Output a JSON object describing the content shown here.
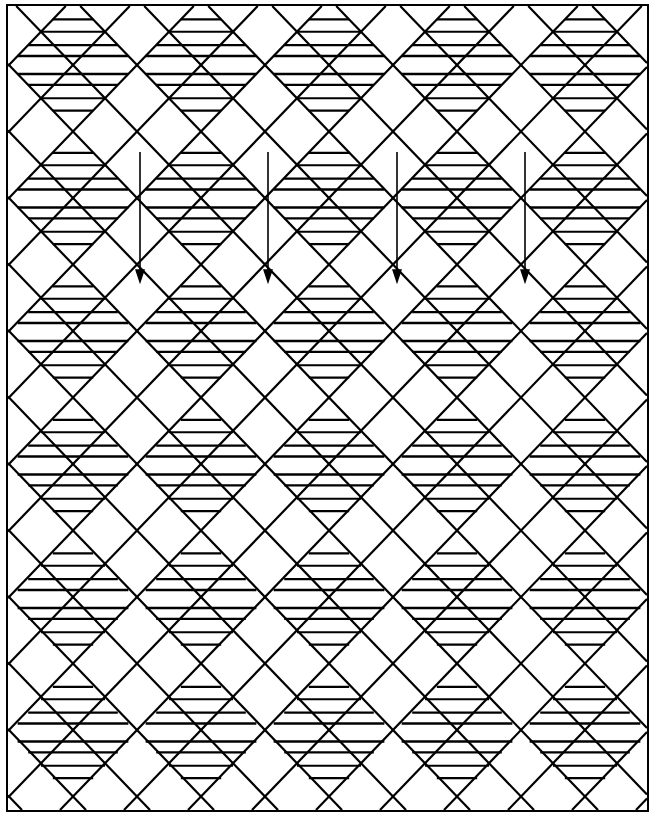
{
  "figure": {
    "type": "lattice-diamond-diagram",
    "columns": 5,
    "edge_marker": "6",
    "arrow_count": 4,
    "edge_markers_left": [
      "6",
      "6",
      "6",
      "6",
      "6",
      "6"
    ],
    "edge_markers_right": [
      "6",
      "6",
      "6",
      "6",
      "6",
      "6"
    ],
    "edge_markers_top": [
      "6",
      "6",
      "6",
      "6"
    ]
  },
  "columns": [
    {
      "index": 0,
      "diamonds": [
        {
          "name": "6y",
          "top": [
            "3",
            "2",
            "16",
            "23"
          ],
          "bottom": [
            "13",
            "4",
            "20",
            "19"
          ]
        },
        {
          "name": "6z",
          "top": [
            "2",
            "16",
            "19",
            "4"
          ],
          "bottom": [
            "13",
            "8",
            "22",
            "16"
          ]
        },
        {
          "name": "6aa",
          "top": [
            "8",
            "2",
            "5",
            "1"
          ],
          "bottom": [
            "8",
            "13",
            "4",
            "6"
          ]
        },
        {
          "name": "6bb",
          "top": [
            "2",
            "23",
            "16",
            "15"
          ],
          "bottom": [
            "19",
            "1",
            "20",
            "4"
          ]
        },
        {
          "name": "6cc",
          "top": [
            "3",
            "4",
            "22",
            "1"
          ],
          "bottom": [
            "8",
            "2",
            "20",
            ""
          ]
        },
        {
          "name": "6dd",
          "top": [
            "7",
            "1",
            "20",
            "24"
          ],
          "bottom": [
            "7",
            "2",
            "1",
            "3"
          ]
        }
      ]
    },
    {
      "index": 1,
      "diamonds": [
        {
          "name": "6s",
          "top": [
            "24",
            "13",
            "1",
            "15"
          ],
          "bottom": [
            "3",
            "11",
            "23",
            "16"
          ]
        },
        {
          "name": "6t",
          "top": [
            "23",
            "17",
            "13",
            "20"
          ],
          "bottom": [
            "3",
            "21",
            "8",
            "15"
          ]
        },
        {
          "name": "6u",
          "top": [
            "4",
            "4",
            "13",
            "23"
          ],
          "bottom": [
            "17",
            "2",
            "15",
            "23"
          ]
        },
        {
          "name": "6v",
          "top": [
            "23",
            "2",
            "13",
            "20"
          ],
          "bottom": [
            "4",
            "17",
            "23",
            "4"
          ]
        },
        {
          "name": "6w",
          "top": [
            "4",
            "20",
            "17",
            "13"
          ],
          "bottom": [
            "2",
            "16",
            "20",
            "8"
          ]
        },
        {
          "name": "6x",
          "top": [
            "3",
            "16",
            "23",
            "4"
          ],
          "bottom": [
            "15",
            "17",
            "13",
            "9"
          ]
        }
      ]
    },
    {
      "index": 2,
      "diamonds": [
        {
          "name": "6m",
          "top": [
            "4",
            "16",
            "2",
            "18"
          ],
          "bottom": [
            "22",
            "4",
            "1",
            "25"
          ]
        },
        {
          "name": "6n",
          "top": [
            "23",
            "17",
            "4",
            "20"
          ],
          "bottom": [
            "13",
            "16",
            "21",
            "10"
          ]
        },
        {
          "name": "6o",
          "top": [
            "16",
            "8",
            "20",
            "2"
          ],
          "bottom": [
            "12",
            "18",
            "13",
            "2"
          ]
        },
        {
          "name": "6p",
          "top": [
            "4",
            "15",
            "2",
            "20"
          ],
          "bottom": [
            "8",
            "1",
            "13",
            "10"
          ]
        },
        {
          "name": "6q",
          "top": [
            "16",
            "2",
            "5",
            "10"
          ],
          "bottom": [
            "8",
            "16",
            "7",
            "13"
          ]
        },
        {
          "name": "6r",
          "top": [
            "1",
            "20",
            "4",
            "13"
          ],
          "bottom": [
            "24",
            "15",
            "16",
            "2"
          ]
        }
      ]
    },
    {
      "index": 3,
      "diamonds": [
        {
          "name": "6g",
          "top": [
            "3",
            "16",
            "20",
            "13"
          ],
          "bottom": [
            "17",
            "23",
            "10",
            "15"
          ]
        },
        {
          "name": "6h",
          "top": [
            "23",
            "17",
            "2",
            "20"
          ],
          "bottom": [
            "12",
            "16",
            "25",
            "15"
          ]
        },
        {
          "name": "6i",
          "top": [
            "23",
            "17",
            "4",
            "20"
          ],
          "bottom": [
            "25",
            "12",
            "16",
            "2"
          ]
        },
        {
          "name": "6j",
          "top": [
            "3",
            "17",
            "22",
            "4"
          ],
          "bottom": [
            "13",
            "17",
            "15",
            "4"
          ]
        },
        {
          "name": "6k",
          "top": [
            "2",
            "23",
            "16",
            "4"
          ],
          "bottom": [
            "5",
            "12",
            "17",
            "15"
          ]
        },
        {
          "name": "6l",
          "top": [
            "12",
            "16",
            "8",
            "15"
          ],
          "bottom": [
            "4",
            "5",
            "17",
            "2"
          ]
        }
      ]
    },
    {
      "index": 4,
      "diamonds": [
        {
          "name": "6 a",
          "top": [
            "15",
            "3",
            "23",
            "16"
          ],
          "bottom": [
            "5",
            "2",
            "12",
            "16"
          ]
        },
        {
          "name": "6 b",
          "top": [
            "2",
            "12",
            "1",
            "5"
          ],
          "bottom": [
            "25",
            "15",
            "17",
            "3"
          ]
        },
        {
          "name": "6 c",
          "top": [
            "13",
            "4",
            "17",
            "15"
          ],
          "bottom": [
            "1",
            "20",
            "4",
            "23"
          ]
        },
        {
          "name": "6 d",
          "top": [
            "23",
            "18",
            "12",
            "2"
          ],
          "bottom": [
            "17",
            "22",
            "13",
            "17"
          ]
        },
        {
          "name": "6 e",
          "top": [
            "23",
            "16",
            "12",
            "8"
          ],
          "bottom": [
            "20",
            "9",
            "13",
            "15"
          ]
        },
        {
          "name": "6 f",
          "top": [
            "2",
            "1",
            "5",
            "7"
          ],
          "bottom": [
            "17",
            "19",
            "12",
            "15"
          ]
        }
      ]
    }
  ]
}
